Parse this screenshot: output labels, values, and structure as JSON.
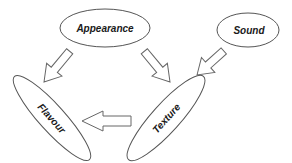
{
  "diagram": {
    "type": "concept-flow",
    "nodes": [
      {
        "id": "appearance",
        "label": "Appearance"
      },
      {
        "id": "sound",
        "label": "Sound"
      },
      {
        "id": "flavour",
        "label": "Flavour"
      },
      {
        "id": "texture",
        "label": "Texture"
      }
    ],
    "edges": [
      {
        "from": "appearance",
        "to": "flavour"
      },
      {
        "from": "appearance",
        "to": "texture"
      },
      {
        "from": "sound",
        "to": "texture"
      },
      {
        "from": "texture",
        "to": "flavour"
      }
    ],
    "colors": {
      "stroke": "#555555",
      "fill": "#ffffff",
      "text": "#1a1a1a"
    }
  }
}
